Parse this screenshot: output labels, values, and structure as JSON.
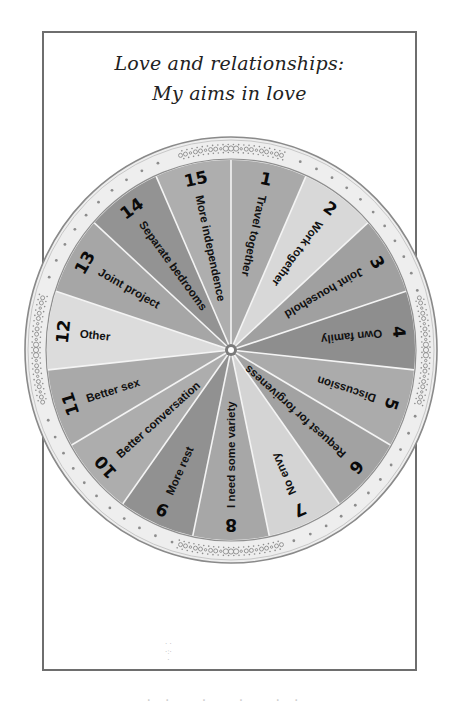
{
  "title": {
    "line1": "Love and relationships:",
    "line2": "My aims in love"
  },
  "wheel": {
    "segment_count": 15,
    "segments": [
      {
        "number": "1",
        "label": "Travel together",
        "color": "#a9a9a9"
      },
      {
        "number": "2",
        "label": "Work together",
        "color": "#d8d8d8"
      },
      {
        "number": "3",
        "label": "Joint household",
        "color": "#a0a0a0"
      },
      {
        "number": "4",
        "label": "Own family",
        "color": "#8e8e8e"
      },
      {
        "number": "5",
        "label": "Discussion",
        "color": "#ababab"
      },
      {
        "number": "6",
        "label": "Request for forgiveness",
        "color": "#a2a2a2"
      },
      {
        "number": "7",
        "label": "No envy",
        "color": "#d4d4d4"
      },
      {
        "number": "8",
        "label": "I need some variety",
        "color": "#a7a7a7"
      },
      {
        "number": "9",
        "label": "More rest",
        "color": "#919191"
      },
      {
        "number": "10",
        "label": "Better conversation",
        "color": "#adadad"
      },
      {
        "number": "11",
        "label": "Better sex",
        "color": "#a9a9a9"
      },
      {
        "number": "12",
        "label": "Other",
        "color": "#dcdcdc"
      },
      {
        "number": "13",
        "label": "Joint project",
        "color": "#a6a6a6"
      },
      {
        "number": "14",
        "label": "Separate bedrooms",
        "color": "#939393"
      },
      {
        "number": "15",
        "label": "More independence",
        "color": "#aeaeae"
      }
    ],
    "ring_color": "#eeeeee",
    "ring_border_color": "#8a8a8a",
    "divider_color": "#f4f4f4",
    "ornament_color": "#8c8c8c"
  },
  "footer": {
    "partial_text": "·· · · ··"
  }
}
